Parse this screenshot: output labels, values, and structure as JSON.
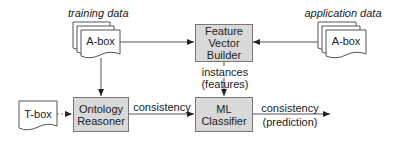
{
  "diagram": {
    "labels": {
      "training_data": "training data",
      "application_data": "application data",
      "instances": "instances",
      "features": "(features)",
      "consistency_mid": "consistency",
      "consistency_out": "consistency",
      "prediction": "(prediction)"
    },
    "documents": {
      "training_abox": "A-box",
      "application_abox": "A-box",
      "tbox": "T-box"
    },
    "nodes": {
      "feature_vector_builder": [
        "Feature",
        "Vector",
        "Builder"
      ],
      "ontology_reasoner": [
        "Ontology",
        "Reasoner"
      ],
      "ml_classifier": [
        "ML",
        "Classifier"
      ]
    },
    "colors": {
      "node_fill": "#d9d9d9",
      "stroke": "#555555"
    }
  }
}
